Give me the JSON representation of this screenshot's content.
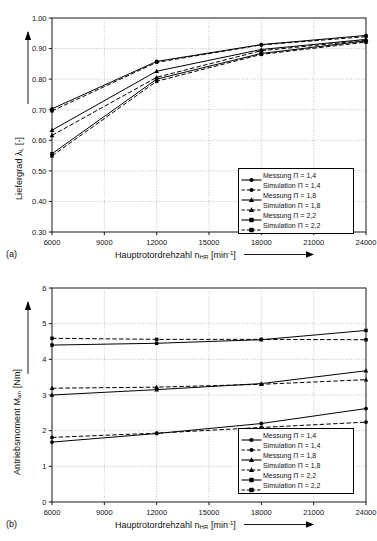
{
  "figure": {
    "panel_a_tag": "(a)",
    "panel_b_tag": "(b)"
  },
  "chart_data": [
    {
      "type": "line",
      "panel": "(a)",
      "title": "",
      "xlabel": "Hauptrotordrehzahl n_HR [min^-1]",
      "ylabel": "Liefergrad λ_L [-]",
      "xlabel_main": "Hauptrotordrehzahl n",
      "xlabel_sub": "HR",
      "xlabel_unit_open": " [min",
      "xlabel_sup": "-1",
      "xlabel_unit_close": "]",
      "ylabel_main": "Liefergrad λ",
      "ylabel_sub": "L",
      "ylabel_unit": " [-]",
      "x": [
        6000,
        12000,
        18000,
        24000
      ],
      "xlim": [
        6000,
        24000
      ],
      "ylim": [
        0.3,
        1.0
      ],
      "xticks": [
        6000,
        9000,
        12000,
        15000,
        18000,
        21000,
        24000
      ],
      "xticklabels": [
        "6000",
        "9000",
        "12000",
        "15000",
        "18000",
        "21000",
        "24000"
      ],
      "yticks": [
        0.3,
        0.4,
        0.5,
        0.6,
        0.7,
        0.8,
        0.9,
        1.0
      ],
      "yticklabels": [
        "0.30",
        "0.40",
        "0.50",
        "0.60",
        "0.70",
        "0.80",
        "0.90",
        "1.00"
      ],
      "grid": true,
      "legend_position": "lower right",
      "series": [
        {
          "name": "Messung Π = 1,4",
          "marker": "circle",
          "style": "solid",
          "values": [
            0.703,
            0.858,
            0.913,
            0.943
          ]
        },
        {
          "name": "Simulation Π = 1,4",
          "marker": "circle",
          "style": "dashed",
          "values": [
            0.696,
            0.855,
            0.912,
            0.939
          ]
        },
        {
          "name": "Messung Π = 1,8",
          "marker": "triangle",
          "style": "solid",
          "values": [
            0.633,
            0.826,
            0.897,
            0.93
          ]
        },
        {
          "name": "Simulation Π = 1,8",
          "marker": "triangle",
          "style": "dashed",
          "values": [
            0.616,
            0.806,
            0.893,
            0.927
          ]
        },
        {
          "name": "Messung Π = 2,2",
          "marker": "square",
          "style": "solid",
          "values": [
            0.556,
            0.8,
            0.884,
            0.925
          ]
        },
        {
          "name": "Simulation Π = 2,2",
          "marker": "square",
          "style": "dashed",
          "values": [
            0.549,
            0.793,
            0.881,
            0.921
          ]
        }
      ]
    },
    {
      "type": "line",
      "panel": "(b)",
      "title": "",
      "xlabel": "Hauptrotordrehzahl n_HR [min^-1]",
      "ylabel": "Antriebsmoment M_an [Nm]",
      "xlabel_main": "Hauptrotordrehzahl n",
      "xlabel_sub": "HR",
      "xlabel_unit_open": " [min",
      "xlabel_sup": "-1",
      "xlabel_unit_close": "]",
      "ylabel_main": "Antriebsmoment M",
      "ylabel_sub": "an",
      "ylabel_unit": " [Nm]",
      "x": [
        6000,
        12000,
        18000,
        24000
      ],
      "xlim": [
        6000,
        24000
      ],
      "ylim": [
        0,
        6
      ],
      "xticks": [
        6000,
        9000,
        12000,
        15000,
        18000,
        21000,
        24000
      ],
      "xticklabels": [
        "6000",
        "9000",
        "12000",
        "15000",
        "18000",
        "21000",
        "24000"
      ],
      "yticks": [
        0,
        1,
        2,
        3,
        4,
        5,
        6
      ],
      "yticklabels": [
        "0",
        "1",
        "2",
        "3",
        "4",
        "5",
        "6"
      ],
      "grid": true,
      "legend_position": "lower right",
      "series": [
        {
          "name": "Messung Π = 1,4",
          "marker": "circle",
          "style": "solid",
          "values": [
            1.68,
            1.92,
            2.2,
            2.62
          ]
        },
        {
          "name": "Simulation Π = 1,4",
          "marker": "circle",
          "style": "dashed",
          "values": [
            1.81,
            1.93,
            2.09,
            2.24
          ]
        },
        {
          "name": "Messung Π = 1,8",
          "marker": "triangle",
          "style": "solid",
          "values": [
            3.0,
            3.15,
            3.32,
            3.68
          ]
        },
        {
          "name": "Simulation Π = 1,8",
          "marker": "triangle",
          "style": "dashed",
          "values": [
            3.19,
            3.22,
            3.3,
            3.43
          ]
        },
        {
          "name": "Messung Π = 2,2",
          "marker": "square",
          "style": "solid",
          "values": [
            4.4,
            4.45,
            4.55,
            4.81
          ]
        },
        {
          "name": "Simulation Π = 2,2",
          "marker": "square",
          "style": "dashed",
          "values": [
            4.59,
            4.56,
            4.56,
            4.55
          ]
        }
      ]
    }
  ]
}
